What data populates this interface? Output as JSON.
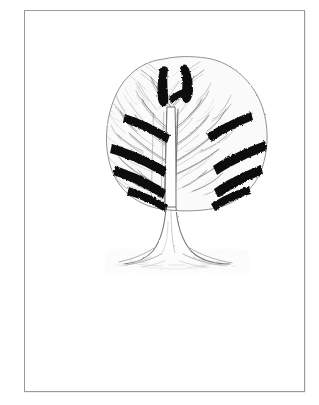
{
  "plate": {
    "background_color": "#ffffff",
    "paper_color": "#fdfdfd",
    "frame_color": "#9a9a9a",
    "ink_color": "#111111",
    "mid_ink_color": "#5a5a5a",
    "light_ink_color": "#a8a8a8",
    "faint_ink_color": "#cfcfcf"
  },
  "illustration": {
    "subject": "tree",
    "style": "engraving",
    "alt_text": "Line engraving of a broad-crowned deciduous tree with dark chevron branch bands",
    "crown": {
      "outline_label": "tree-crown-outline",
      "fill_texture": "fine-branch-hatching",
      "center_x": 163,
      "center_y": 131,
      "width": 130,
      "height": 148
    },
    "trunk": {
      "label": "tree-trunk",
      "top_y": 194,
      "base_y": 246,
      "width": 11
    },
    "roots": {
      "label": "root-flare",
      "ground_y": 252,
      "spread": 112
    },
    "crown_fork": {
      "label": "top-branch-fork",
      "top_y": 58,
      "shape": "Y"
    },
    "bands": [
      {
        "name": "band-1-left",
        "row": 1,
        "side": "left"
      },
      {
        "name": "band-1-right",
        "row": 1,
        "side": "right"
      },
      {
        "name": "band-2-left",
        "row": 2,
        "side": "left"
      },
      {
        "name": "band-2-right",
        "row": 2,
        "side": "right"
      },
      {
        "name": "band-3-left",
        "row": 3,
        "side": "left"
      },
      {
        "name": "band-3-right",
        "row": 3,
        "side": "right"
      },
      {
        "name": "band-4-left",
        "row": 4,
        "side": "left"
      },
      {
        "name": "band-4-right",
        "row": 4,
        "side": "right"
      }
    ]
  }
}
